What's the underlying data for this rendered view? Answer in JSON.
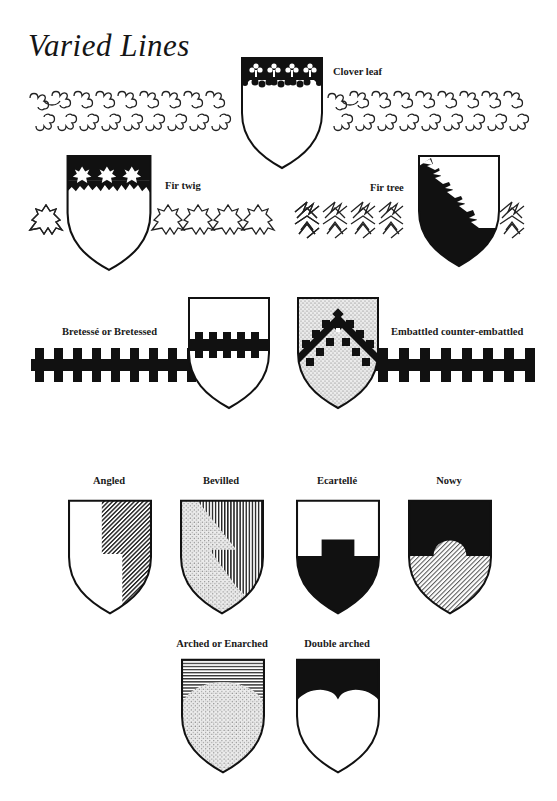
{
  "page": {
    "title": "Varied Lines",
    "ink_color": "#111111",
    "paper_color": "#ffffff"
  },
  "figures": [
    {
      "id": "clover-leaf",
      "label": "Clover leaf",
      "tinctures": [
        "black chief",
        "white field"
      ]
    },
    {
      "id": "fir-twig",
      "label": "Fir twig",
      "tinctures": [
        "black chief",
        "white field"
      ]
    },
    {
      "id": "fir-tree",
      "label": "Fir tree",
      "tinctures": [
        "black bend sinister side",
        "white field"
      ]
    },
    {
      "id": "bretesse",
      "label": "Bretessé or Bretessed",
      "tinctures": [
        "white field",
        "black bar"
      ]
    },
    {
      "id": "embattled-counter-embattled",
      "label": "Embattled counter-embattled",
      "tinctures": [
        "stippled field",
        "black chevron"
      ]
    },
    {
      "id": "angled",
      "label": "Angled",
      "tinctures": [
        "white",
        "diagonal hatching"
      ]
    },
    {
      "id": "bevilled",
      "label": "Bevilled",
      "tinctures": [
        "stippled",
        "vertical hatching"
      ]
    },
    {
      "id": "ecartelle",
      "label": "Ecartellé",
      "tinctures": [
        "white",
        "black"
      ]
    },
    {
      "id": "nowy",
      "label": "Nowy",
      "tinctures": [
        "black",
        "diagonal hatching"
      ]
    },
    {
      "id": "arched",
      "label": "Arched or Enarched",
      "tinctures": [
        "horizontal hatching",
        "stippled"
      ]
    },
    {
      "id": "double-arched",
      "label": "Double arched",
      "tinctures": [
        "black",
        "white"
      ]
    }
  ]
}
